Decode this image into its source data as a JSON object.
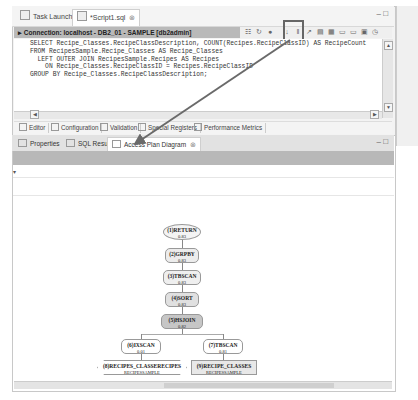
{
  "top_tabs": [
    {
      "label": "Task Launcher",
      "icon": "launcher-icon"
    },
    {
      "label": "*Script1.sql",
      "icon": "sql-file-icon",
      "close": "⊗"
    }
  ],
  "window_buttons": {
    "minimize": "–",
    "maximize": "□"
  },
  "connection": {
    "label": "Connection: localhost - DB2_01 - SAMPLE [db2admin]"
  },
  "toolbar": {
    "icons": [
      "☷",
      "↻",
      "●",
      "↓",
      "‖",
      "↗",
      "▤",
      "▦",
      "▭",
      "▭",
      "▣",
      "◷"
    ],
    "highlighted": "explain-access-plan-icon"
  },
  "sql": {
    "lines": [
      "SELECT Recipe_Classes.RecipeClassDescription, COUNT(Recipes.RecipeClassID) AS RecipeCount",
      "FROM RecipesSample.Recipe_Classes AS Recipe_Classes",
      "  LEFT OUTER JOIN RecipesSample.Recipes AS Recipes",
      "    ON Recipe_Classes.RecipeClassID = Recipes.RecipeClassID",
      "GROUP BY Recipe_Classes.RecipeClassDescription;"
    ]
  },
  "editor_tabs": [
    {
      "label": "Editor"
    },
    {
      "label": "Configuration"
    },
    {
      "label": "Validation"
    },
    {
      "label": "Special Registers"
    },
    {
      "label": "Performance Metrics"
    }
  ],
  "panel_tabs": [
    {
      "label": "Properties"
    },
    {
      "label": "SQL Results"
    },
    {
      "label": "Access Plan Diagram",
      "close": "⊗"
    }
  ],
  "panel_buttons": {
    "minimize": "–",
    "maximize": "□"
  },
  "row_marker": "▾",
  "diagram": {
    "nodes": [
      {
        "id": "1",
        "op": "RETURN",
        "cost": "0.83"
      },
      {
        "id": "2",
        "op": "GRPBY",
        "cost": "0.83"
      },
      {
        "id": "3",
        "op": "TBSCAN",
        "cost": "0.83"
      },
      {
        "id": "4",
        "op": "SORT",
        "cost": "0.83"
      },
      {
        "id": "5",
        "op": "HSJOIN",
        "cost": "0.82"
      },
      {
        "id": "6",
        "op": "IXSCAN",
        "cost": "0.01"
      },
      {
        "id": "7",
        "op": "TBSCAN",
        "cost": "0.81"
      },
      {
        "id": "8",
        "op": "RECIPES_CLASSERECIPES",
        "cost": "RECIPESSAMPLE"
      },
      {
        "id": "9",
        "op": "RECIPE_CLASSES",
        "cost": "RECIPESSAMPLE"
      }
    ]
  }
}
